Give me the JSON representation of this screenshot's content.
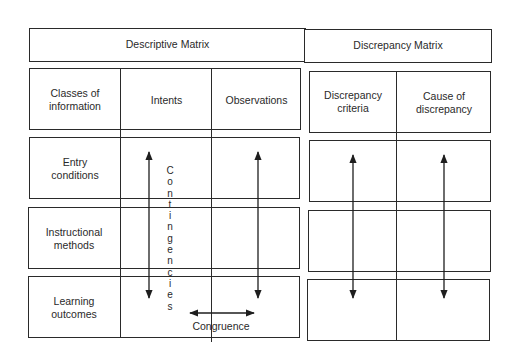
{
  "header": {
    "descriptive_matrix": "Descriptive Matrix",
    "discrepancy_matrix": "Discrepancy Matrix"
  },
  "columns": {
    "classes": "Classes of information",
    "classes_line1": "Classes of",
    "classes_line2": "information",
    "intents": "Intents",
    "observations": "Observations",
    "criteria_line1": "Discrepancy",
    "criteria_line2": "criteria",
    "cause_line1": "Cause of",
    "cause_line2": "discrepancy"
  },
  "rows": [
    {
      "line1": "Entry",
      "line2": "conditions"
    },
    {
      "line1": "Instructional",
      "line2": "methods"
    },
    {
      "line1": "Learning",
      "line2": "outcomes"
    }
  ],
  "annotations": {
    "contingencies": "Contingencies",
    "congruence": "Congruence"
  }
}
